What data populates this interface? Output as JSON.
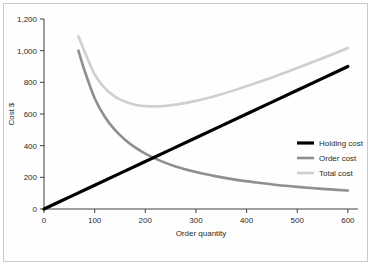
{
  "chart_data": {
    "type": "line",
    "title": "",
    "xlabel": "Order quantity",
    "ylabel": "Cost $",
    "xlim": [
      0,
      620
    ],
    "ylim": [
      0,
      1200
    ],
    "grid": false,
    "legend_position": "right-middle",
    "x_ticks": [
      "0",
      "100",
      "200",
      "300",
      "400",
      "500",
      "600"
    ],
    "x_tick_values": [
      0,
      100,
      200,
      300,
      400,
      500,
      600
    ],
    "y_ticks": [
      "0",
      "200",
      "400",
      "600",
      "800",
      "1,000",
      "1,200"
    ],
    "y_tick_values": [
      0,
      200,
      400,
      600,
      800,
      1000,
      1200
    ],
    "series": [
      {
        "name": "Holding cost",
        "color": "#000000",
        "width": 3.2,
        "x": [
          0,
          50,
          100,
          150,
          200,
          250,
          300,
          350,
          400,
          450,
          500,
          550,
          600
        ],
        "values": [
          0,
          75,
          150,
          225,
          300,
          375,
          450,
          525,
          600,
          675,
          750,
          825,
          900
        ]
      },
      {
        "name": "Order cost",
        "color": "#8f8f8f",
        "width": 2.6,
        "x": [
          68,
          80,
          100,
          120,
          140,
          160,
          180,
          200,
          230,
          260,
          300,
          340,
          380,
          420,
          460,
          500,
          550,
          600
        ],
        "values": [
          1000,
          875,
          700,
          583,
          500,
          438,
          389,
          350,
          304,
          269,
          233,
          206,
          184,
          167,
          152,
          140,
          127,
          117
        ]
      },
      {
        "name": "Total cost",
        "color": "#cfcfcf",
        "width": 2.6,
        "x": [
          68,
          80,
          100,
          120,
          140,
          160,
          180,
          200,
          230,
          260,
          300,
          340,
          380,
          420,
          460,
          500,
          550,
          600
        ],
        "values": [
          1090,
          995,
          850,
          763,
          710,
          678,
          659,
          650,
          649,
          659,
          683,
          716,
          754,
          797,
          842,
          890,
          952,
          1017
        ]
      }
    ]
  },
  "legend": {
    "items": [
      {
        "label": "Holding cost"
      },
      {
        "label": "Order cost"
      },
      {
        "label": "Total cost"
      }
    ]
  }
}
